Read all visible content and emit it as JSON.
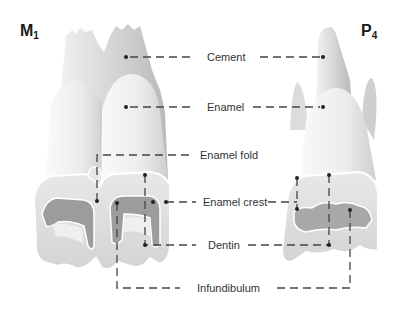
{
  "figure": {
    "left_tooth": {
      "name": "M",
      "subscript": "1"
    },
    "right_tooth": {
      "name": "P",
      "subscript": "4"
    },
    "labels": [
      {
        "id": "cement",
        "text": "Cement"
      },
      {
        "id": "enamel",
        "text": "Enamel"
      },
      {
        "id": "enamel_fold",
        "text": "Enamel fold"
      },
      {
        "id": "enamel_crest",
        "text": "Enamel crest"
      },
      {
        "id": "dentin",
        "text": "Dentin"
      },
      {
        "id": "infundibulum",
        "text": "Infundibulum"
      }
    ],
    "colors": {
      "leader_line": "#444444",
      "tooth_light": "#ececec",
      "tooth_mid": "#cfcfcf",
      "tooth_dark": "#8a8a8a",
      "background": "#ffffff"
    }
  }
}
